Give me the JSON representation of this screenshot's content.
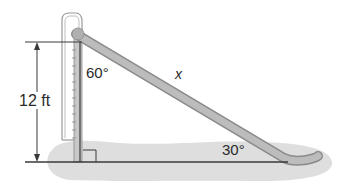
{
  "diagram": {
    "labels": {
      "height": "12 ft",
      "top_angle": "60°",
      "hypotenuse": "x",
      "bottom_angle": "30°"
    },
    "right_angle_marker": true,
    "colors": {
      "line": "#3a3a3a",
      "slide_fill": "#b5b5b5",
      "slide_edge": "#8a8a8a",
      "ground_shadow": "#dcdcdc",
      "post_outline": "#9a9a9a"
    }
  }
}
